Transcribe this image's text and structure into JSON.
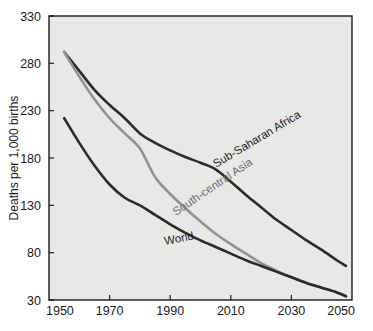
{
  "chart_data": {
    "type": "line",
    "title": "",
    "xlabel": "",
    "ylabel": "Deaths per 1,000 births",
    "xlim": [
      1950,
      2050
    ],
    "ylim": [
      30,
      330
    ],
    "xticks": [
      1950,
      1970,
      1990,
      2010,
      2030,
      2050
    ],
    "yticks": [
      30,
      80,
      130,
      180,
      230,
      280,
      330
    ],
    "xtick_labels": [
      "1950",
      "1970",
      "1990",
      "2010",
      "2030",
      "2050"
    ],
    "ytick_labels": [
      "30",
      "80",
      "130",
      "180",
      "230",
      "280",
      "330"
    ],
    "grid": false,
    "legend_position": "inline-labels",
    "plot_background": "#e8e8e6",
    "figure_background": "#ffffff",
    "series": [
      {
        "name": "Sub-Saharan Africa",
        "color": "#2b2b2b",
        "label_rotation": -31,
        "x": [
          1955,
          1960,
          1965,
          1970,
          1975,
          1980,
          1985,
          1990,
          1995,
          2000,
          2005,
          2010,
          2015,
          2020,
          2025,
          2030,
          2035,
          2040,
          2045,
          2048
        ],
        "values": [
          292,
          272,
          252,
          236,
          222,
          206,
          196,
          188,
          181,
          175,
          168,
          155,
          141,
          128,
          115,
          104,
          93,
          83,
          72,
          66
        ]
      },
      {
        "name": "South-central Asia",
        "color": "#919191",
        "label_rotation": -34,
        "x": [
          1955,
          1960,
          1965,
          1970,
          1975,
          1980,
          1985,
          1990,
          1995,
          2000,
          2005,
          2010,
          2015,
          2020,
          2025,
          2030,
          2035,
          2040,
          2045,
          2048
        ],
        "values": [
          292,
          266,
          242,
          222,
          206,
          190,
          160,
          142,
          127,
          113,
          100,
          89,
          79,
          69,
          61,
          54,
          48,
          43,
          38,
          34
        ]
      },
      {
        "name": "World",
        "color": "#2b2b2b",
        "label_rotation": -11,
        "x": [
          1955,
          1960,
          1965,
          1970,
          1975,
          1980,
          1985,
          1990,
          1995,
          2000,
          2005,
          2010,
          2015,
          2020,
          2025,
          2030,
          2035,
          2040,
          2045,
          2048
        ],
        "values": [
          222,
          196,
          172,
          152,
          138,
          130,
          120,
          110,
          101,
          93,
          86,
          79,
          72,
          66,
          60,
          54,
          48,
          43,
          38,
          34
        ]
      }
    ]
  },
  "axis": {
    "y_title": "Deaths per 1,000 births"
  },
  "labels": {
    "sub_saharan_africa": "Sub-Saharan Africa",
    "south_central_asia": "South-central Asia",
    "world": "World"
  }
}
